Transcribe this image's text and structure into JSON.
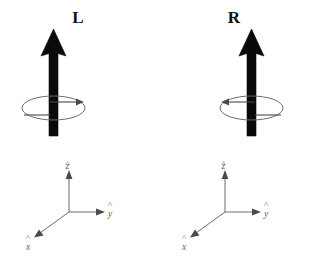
{
  "figure": {
    "background_color": "#ffffff",
    "vector_color": "#0a0a0a",
    "ellipse_color": "#6b6b6b",
    "axis_color": "#6b6b6b",
    "panels": [
      {
        "id": "left",
        "label": "L",
        "handedness": "left-circular",
        "spin_arrow_direction": "right",
        "vector_direction": "up",
        "axes": {
          "z": {
            "symbol": "z",
            "hat": "^",
            "direction": "up"
          },
          "y": {
            "symbol": "y",
            "hat": "^",
            "direction": "right"
          },
          "x": {
            "symbol": "x",
            "hat": "^",
            "direction": "down-left"
          }
        }
      },
      {
        "id": "right",
        "label": "R",
        "handedness": "right-circular",
        "spin_arrow_direction": "left",
        "vector_direction": "up",
        "axes": {
          "z": {
            "symbol": "z",
            "hat": "^",
            "direction": "up"
          },
          "y": {
            "symbol": "y",
            "hat": "^",
            "direction": "right"
          },
          "x": {
            "symbol": "x",
            "hat": "^",
            "direction": "down-left"
          }
        }
      }
    ]
  }
}
